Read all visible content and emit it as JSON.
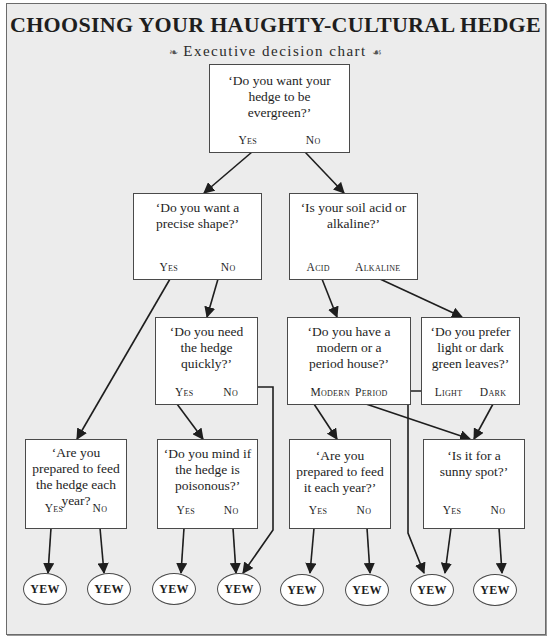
{
  "header": {
    "title": "CHOOSING YOUR HAUGHTY-CULTURAL HEDGE",
    "subtitle": "Executive decision chart",
    "ornament_left": "❧",
    "ornament_right": "☙"
  },
  "nodes": {
    "evergreen": {
      "question": "‘Do you want your hedge to be evergreen?’",
      "options": [
        "Yes",
        "No"
      ]
    },
    "precise_shape": {
      "question": "‘Do you want a precise shape?’",
      "options": [
        "Yes",
        "No"
      ]
    },
    "soil": {
      "question": "‘Is your soil acid or alkaline?’",
      "options": [
        "Acid",
        "Alkaline"
      ]
    },
    "quickly": {
      "question": "‘Do you need the hedge quickly?’",
      "options": [
        "Yes",
        "No"
      ]
    },
    "house": {
      "question": "‘Do you have a modern or a period house?’",
      "options": [
        "Modern",
        "Period"
      ]
    },
    "leaves": {
      "question": "‘Do you prefer light or dark green leaves?’",
      "options": [
        "Light",
        "Dark"
      ]
    },
    "feed_hedge": {
      "question": "‘Are you prepared to feed the hedge each year?",
      "options": [
        "Yes",
        "No"
      ]
    },
    "poisonous": {
      "question": "‘Do you mind if the hedge is poisonous?’",
      "options": [
        "Yes",
        "No"
      ]
    },
    "feed_it": {
      "question": "‘Are you prepared to feed it each year?’",
      "options": [
        "Yes",
        "No"
      ]
    },
    "sunny": {
      "question": "‘Is it for a sunny spot?’",
      "options": [
        "Yes",
        "No"
      ]
    }
  },
  "outcomes": [
    "YEW",
    "YEW",
    "YEW",
    "YEW",
    "YEW",
    "YEW",
    "YEW",
    "YEW"
  ],
  "edges": [
    {
      "from": "evergreen",
      "answer": "Yes",
      "to": "precise_shape"
    },
    {
      "from": "evergreen",
      "answer": "No",
      "to": "soil"
    },
    {
      "from": "precise_shape",
      "answer": "Yes",
      "to": "feed_hedge"
    },
    {
      "from": "precise_shape",
      "answer": "No",
      "to": "quickly"
    },
    {
      "from": "soil",
      "answer": "Acid",
      "to": "house"
    },
    {
      "from": "soil",
      "answer": "Alkaline",
      "to": "leaves"
    },
    {
      "from": "quickly",
      "answer": "Yes",
      "to": "poisonous"
    },
    {
      "from": "quickly",
      "answer": "No",
      "to": "outcome_4"
    },
    {
      "from": "house",
      "answer": "Modern",
      "to": "feed_it"
    },
    {
      "from": "house",
      "answer": "Period",
      "to": "sunny"
    },
    {
      "from": "leaves",
      "answer": "Light",
      "to": "outcome_7"
    },
    {
      "from": "leaves",
      "answer": "Dark",
      "to": "sunny"
    },
    {
      "from": "feed_hedge",
      "answer": "Yes",
      "to": "outcome_1"
    },
    {
      "from": "feed_hedge",
      "answer": "No",
      "to": "outcome_2"
    },
    {
      "from": "poisonous",
      "answer": "Yes",
      "to": "outcome_3"
    },
    {
      "from": "poisonous",
      "answer": "No",
      "to": "outcome_4"
    },
    {
      "from": "feed_it",
      "answer": "Yes",
      "to": "outcome_5"
    },
    {
      "from": "feed_it",
      "answer": "No",
      "to": "outcome_6"
    },
    {
      "from": "sunny",
      "answer": "Yes",
      "to": "outcome_7"
    },
    {
      "from": "sunny",
      "answer": "No",
      "to": "outcome_8"
    }
  ],
  "colors": {
    "background": "#ececec",
    "box_fill": "#ffffff",
    "line": "#1e1e1e"
  }
}
